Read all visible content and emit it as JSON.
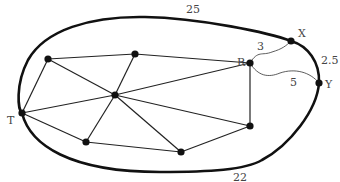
{
  "diagram": {
    "type": "graph-in-region",
    "boundary_labels": {
      "top": "25",
      "bottom": "22",
      "right": "2.5"
    },
    "nodes": [
      {
        "id": "A",
        "label": ""
      },
      {
        "id": "B",
        "label": ""
      },
      {
        "id": "C",
        "label": ""
      },
      {
        "id": "T",
        "label": "T"
      },
      {
        "id": "D",
        "label": ""
      },
      {
        "id": "E",
        "label": ""
      },
      {
        "id": "F",
        "label": ""
      },
      {
        "id": "R",
        "label": "R"
      },
      {
        "id": "X",
        "label": "X"
      },
      {
        "id": "Y",
        "label": "Y"
      }
    ],
    "edges": [
      {
        "from": "A",
        "to": "B"
      },
      {
        "from": "A",
        "to": "T"
      },
      {
        "from": "A",
        "to": "C"
      },
      {
        "from": "B",
        "to": "R"
      },
      {
        "from": "B",
        "to": "C"
      },
      {
        "from": "T",
        "to": "C"
      },
      {
        "from": "T",
        "to": "D"
      },
      {
        "from": "C",
        "to": "R"
      },
      {
        "from": "C",
        "to": "D"
      },
      {
        "from": "C",
        "to": "E"
      },
      {
        "from": "C",
        "to": "F"
      },
      {
        "from": "D",
        "to": "E"
      },
      {
        "from": "E",
        "to": "F"
      },
      {
        "from": "R",
        "to": "F"
      }
    ],
    "curved_edges": [
      {
        "from": "R",
        "to": "X",
        "label": "3"
      },
      {
        "from": "R",
        "to": "Y",
        "label": "5"
      }
    ]
  }
}
